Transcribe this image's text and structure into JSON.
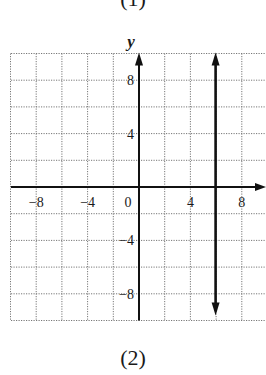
{
  "top_caption_fragment": "(1)",
  "caption": "(2)",
  "chart_data": {
    "type": "line",
    "title": "",
    "xlabel": "",
    "ylabel": "y",
    "xlim": [
      -10,
      10
    ],
    "ylim": [
      -10,
      10
    ],
    "grid": true,
    "grid_step": 2,
    "x_ticks": [
      -8,
      -4,
      0,
      4,
      8
    ],
    "x_tick_labels": [
      "−8",
      "−4",
      "0",
      "4",
      "8"
    ],
    "y_ticks": [
      8,
      4,
      -4,
      -8
    ],
    "y_tick_labels": [
      "8",
      "4",
      "−4",
      "−8"
    ],
    "series": [
      {
        "name": "x = 6",
        "kind": "vertical-line",
        "x": [
          6,
          6
        ],
        "y": [
          -10,
          10
        ],
        "arrows": "both"
      }
    ]
  }
}
